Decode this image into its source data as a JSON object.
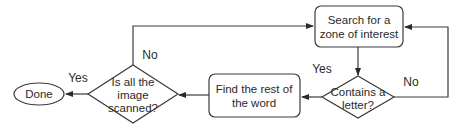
{
  "diagram": {
    "type": "flowchart",
    "nodes": {
      "search": {
        "shape": "rounded-rectangle",
        "line1": "Search for a",
        "line2": "zone of interest"
      },
      "contains": {
        "shape": "diamond",
        "line1": "Contains a",
        "line2": "letter?"
      },
      "find": {
        "shape": "rounded-rectangle",
        "line1": "Find the rest of",
        "line2": "the word"
      },
      "scanned": {
        "shape": "diamond",
        "line1": "Is all the",
        "line2": "image",
        "line3": "scanned?"
      },
      "done": {
        "shape": "ellipse",
        "label": "Done"
      }
    },
    "edges": [
      {
        "from": "search",
        "to": "contains",
        "label": ""
      },
      {
        "from": "contains",
        "to": "find",
        "label": "Yes"
      },
      {
        "from": "contains",
        "to": "search",
        "label": "No"
      },
      {
        "from": "find",
        "to": "scanned",
        "label": ""
      },
      {
        "from": "scanned",
        "to": "done",
        "label": "Yes"
      },
      {
        "from": "scanned",
        "to": "search",
        "label": "No"
      }
    ],
    "labels": {
      "contains_yes": "Yes",
      "contains_no": "No",
      "scanned_yes": "Yes",
      "scanned_no": "No"
    },
    "colors": {
      "stroke": "#3a3a3a",
      "text": "#2a2a2a",
      "background": "#ffffff"
    }
  }
}
